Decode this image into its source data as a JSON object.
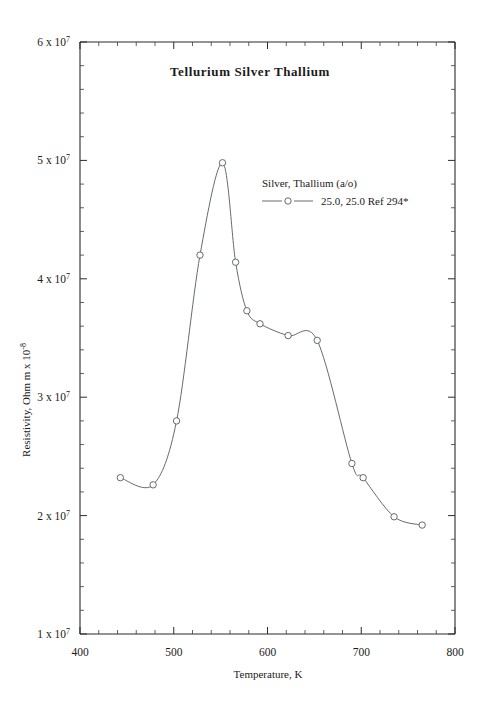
{
  "chart_data": {
    "type": "line",
    "title": "Tellurium  Silver  Thallium",
    "xlabel": "Temperature,  K",
    "ylabel_main": "Resistivity, Ohm m x 10",
    "ylabel_exponent": "-8",
    "xlim": [
      400,
      800
    ],
    "ylim": [
      10000000,
      60000000
    ],
    "grid": false,
    "legend_position": "inside-upper-right",
    "legend_header": "Silver, Thallium (a/o)",
    "xticks": [
      {
        "value": 400,
        "label": "400"
      },
      {
        "value": 500,
        "label": "500"
      },
      {
        "value": 600,
        "label": "600"
      },
      {
        "value": 700,
        "label": "700"
      },
      {
        "value": 800,
        "label": "800"
      }
    ],
    "x_minor_step": 20,
    "yticks": [
      {
        "value": 10000000,
        "mantissa": "1 x 10",
        "exponent": "7"
      },
      {
        "value": 20000000,
        "mantissa": "2 x 10",
        "exponent": "7"
      },
      {
        "value": 30000000,
        "mantissa": "3 x 10",
        "exponent": "7"
      },
      {
        "value": 40000000,
        "mantissa": "4 x 10",
        "exponent": "7"
      },
      {
        "value": 50000000,
        "mantissa": "5 x 10",
        "exponent": "7"
      },
      {
        "value": 60000000,
        "mantissa": "6 x 10",
        "exponent": "7"
      }
    ],
    "y_minor_step": 2000000,
    "series": [
      {
        "name": "25.0, 25.0 Ref 294*",
        "legend_label": "25.0, 25.0 Ref 294*",
        "marker": "open-circle",
        "color": "#555a60",
        "x": [
          443,
          478,
          503,
          528,
          552,
          566,
          578,
          592,
          622,
          653,
          690,
          702,
          735,
          765
        ],
        "y": [
          23200000,
          22600000,
          28000000,
          42000000,
          49800000,
          41400000,
          37300000,
          36200000,
          35200000,
          34800000,
          24400000,
          23200000,
          19900000,
          19200000
        ]
      }
    ]
  },
  "axes_geometry": {
    "left_px": 80,
    "right_px": 455,
    "top_px": 42,
    "bottom_px": 634
  }
}
